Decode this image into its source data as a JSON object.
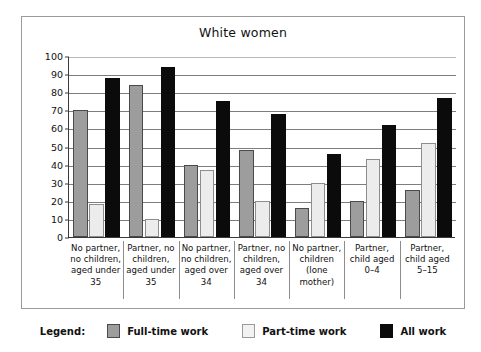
{
  "chart_data": {
    "type": "bar",
    "title": "White women",
    "xlabel": "",
    "ylabel": "",
    "ylim": [
      0,
      100
    ],
    "yticks": [
      0,
      10,
      20,
      30,
      40,
      50,
      60,
      70,
      80,
      90,
      100
    ],
    "grid": true,
    "legend_position": "bottom",
    "categories": [
      "No partner, no children, aged under 35",
      "Partner, no children, aged under 35",
      "No partner, no children, aged over 34",
      "Partner, no children, aged over 34",
      "No partner, children (lone mother)",
      "Partner, child aged 0–4",
      "Partner, child aged 5–15"
    ],
    "category_lines": [
      [
        "No partner,",
        "no children,",
        "aged under",
        "35"
      ],
      [
        "Partner, no",
        "children,",
        "aged under",
        "35"
      ],
      [
        "No partner,",
        "no children,",
        "aged over",
        "34"
      ],
      [
        "Partner, no",
        "children,",
        "aged over",
        "34"
      ],
      [
        "No partner,",
        "children",
        "(lone",
        "mother)"
      ],
      [
        "Partner,",
        "child aged",
        "0–4"
      ],
      [
        "Partner,",
        "child aged",
        "5–15"
      ]
    ],
    "series": [
      {
        "name": "Full-time work",
        "color": "#9d9d9d",
        "values": [
          70,
          84,
          40,
          48,
          16,
          20,
          26
        ]
      },
      {
        "name": "Part-time work",
        "color": "#ececec",
        "values": [
          18,
          10,
          37,
          20,
          30,
          43,
          52
        ]
      },
      {
        "name": "All work",
        "color": "#0b0b0b",
        "values": [
          88,
          94,
          75,
          68,
          46,
          62,
          77
        ]
      }
    ]
  },
  "legend": {
    "title": "Legend:",
    "entries": [
      {
        "label": "Full-time work",
        "swatch": "full-time"
      },
      {
        "label": "Part-time work",
        "swatch": "part-time"
      },
      {
        "label": "All work",
        "swatch": "all-work"
      }
    ]
  }
}
